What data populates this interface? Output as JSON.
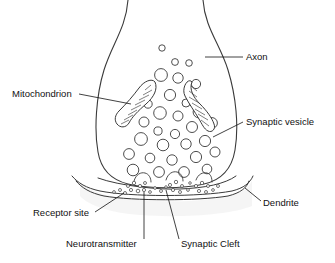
{
  "figure": {
    "style": {
      "stroke": "#3a3a3a",
      "fill": "#ffffff",
      "shade": "#f0f0f0",
      "text": "#111111",
      "background": "#ffffff"
    }
  },
  "labels": [
    {
      "id": "axon",
      "text": "Axon",
      "x": 246,
      "y": 60,
      "anchor": "start",
      "leader": "M 243 57 L 205 57"
    },
    {
      "id": "mitochondrion",
      "text": "Mitochondrion",
      "x": 12,
      "y": 97,
      "anchor": "start",
      "leader": "M 79 94 L 131 104"
    },
    {
      "id": "synaptic-vesicle",
      "text": "Synaptic vesicle",
      "x": 246,
      "y": 125,
      "anchor": "start",
      "leader": "M 243 122 L 213 137"
    },
    {
      "id": "receptor-site",
      "text": "Receptor site",
      "x": 33,
      "y": 216,
      "anchor": "start",
      "leader": "M 95 212 L 124 193"
    },
    {
      "id": "dendrite",
      "text": "Dendrite",
      "x": 263,
      "y": 206,
      "anchor": "start",
      "leader": "M 261 201 L 245 188"
    },
    {
      "id": "neurotransmitter",
      "text": "Neurotransmitter",
      "x": 66,
      "y": 247,
      "anchor": "start",
      "leader": "M 144 239 L 144 192"
    },
    {
      "id": "synaptic-cleft",
      "text": "Synaptic Cleft",
      "x": 181,
      "y": 247,
      "anchor": "start",
      "leader": "M 179 239 L 166 190"
    }
  ],
  "axon_terminal": {
    "outline": "M 128 0 C 126 28 112 44 104 70 C 96 96 94 130 98 152 C 101 170 112 180 128 184 C 150 189 182 189 204 184 C 222 180 232 168 235 150 C 239 126 236 96 228 70 C 220 44 205 28 203 0"
  },
  "vesicles": [
    {
      "cx": 162,
      "cy": 48,
      "r": 3.2
    },
    {
      "cx": 175,
      "cy": 62,
      "r": 3.4
    },
    {
      "cx": 189,
      "cy": 63,
      "r": 3.3
    },
    {
      "cx": 161,
      "cy": 75,
      "r": 6.4
    },
    {
      "cx": 178,
      "cy": 78,
      "r": 5.2
    },
    {
      "cx": 196,
      "cy": 84,
      "r": 4.6
    },
    {
      "cx": 170,
      "cy": 95,
      "r": 5.6
    },
    {
      "cx": 148,
      "cy": 104,
      "r": 4.2
    },
    {
      "cx": 186,
      "cy": 103,
      "r": 4.0
    },
    {
      "cx": 160,
      "cy": 113,
      "r": 6.3
    },
    {
      "cx": 178,
      "cy": 116,
      "r": 5.0
    },
    {
      "cx": 199,
      "cy": 112,
      "r": 5.9
    },
    {
      "cx": 144,
      "cy": 122,
      "r": 5.0
    },
    {
      "cx": 192,
      "cy": 127,
      "r": 5.5
    },
    {
      "cx": 212,
      "cy": 123,
      "r": 5.4
    },
    {
      "cx": 158,
      "cy": 131,
      "r": 4.1
    },
    {
      "cx": 175,
      "cy": 134,
      "r": 4.6
    },
    {
      "cx": 141,
      "cy": 139,
      "r": 6.4
    },
    {
      "cx": 163,
      "cy": 145,
      "r": 5.8
    },
    {
      "cx": 186,
      "cy": 144,
      "r": 5.2
    },
    {
      "cx": 205,
      "cy": 141,
      "r": 5.6
    },
    {
      "cx": 129,
      "cy": 154,
      "r": 5.4
    },
    {
      "cx": 150,
      "cy": 158,
      "r": 4.8
    },
    {
      "cx": 172,
      "cy": 160,
      "r": 5.2
    },
    {
      "cx": 196,
      "cy": 157,
      "r": 5.6
    },
    {
      "cx": 215,
      "cy": 152,
      "r": 5.0
    },
    {
      "cx": 133,
      "cy": 170,
      "r": 5.8
    },
    {
      "cx": 159,
      "cy": 172,
      "r": 5.4
    },
    {
      "cx": 184,
      "cy": 172,
      "r": 5.4
    },
    {
      "cx": 207,
      "cy": 169,
      "r": 4.8
    }
  ],
  "mitochondria": [
    {
      "id": "mitochondrion-left",
      "outline": "M 155 82 C 158 89 154 97 146 104 C 138 111 132 117 129 123 C 126 128 120 128 117 124 C 114 120 115 115 119 111 C 127 103 133 96 139 88 C 144 81 152 78 155 82 Z",
      "cristae": [
        "M 151 85 L 145 90",
        "M 152 90 L 143 95",
        "M 149 95 L 139 100",
        "M 145 100 L 135 105",
        "M 141 105 L 131 110",
        "M 137 110 L 128 115",
        "M 133 115 L 124 120",
        "M 129 120 L 121 124"
      ]
    },
    {
      "id": "mitochondrion-right",
      "outline": "M 192 82 C 189 89 193 97 200 104 C 207 111 212 118 214 124 C 216 129 212 133 208 131 C 204 129 202 124 199 119 C 195 112 189 104 185 96 C 181 88 188 77 192 82 Z",
      "cristae": [
        "M 191 86 L 197 91",
        "M 189 91 L 197 97",
        "M 189 97 L 199 103",
        "M 192 103 L 202 109",
        "M 195 109 L 205 115",
        "M 198 114 L 208 120",
        "M 201 120 L 209 126"
      ]
    }
  ],
  "cleft": {
    "presynaptic_membrane": "M 98 178 C 120 186 160 190 180 189 C 205 188 225 184 236 176",
    "postsynaptic_membrane_top": "M 72 176 C 78 183 86 188 100 191 C 130 197 200 197 232 191 C 244 188 250 183 253 176",
    "postsynaptic_membrane_bottom": "M 76 181 C 82 188 90 193 104 196 C 133 201 198 201 228 196 C 240 193 247 188 249 181",
    "release_notches": [
      "M 134 181 C 136 174 141 172 145 173 C 149 174 151 178 151 182",
      "M 166 180 C 168 173 173 171 177 172 C 181 173 183 177 183 181",
      "M 196 180 C 198 174 203 172 207 173 C 211 174 212 178 212 182"
    ]
  },
  "neurotransmitters": [
    {
      "cx": 128,
      "cy": 186,
      "r": 1.5
    },
    {
      "cx": 134,
      "cy": 183,
      "r": 1.7
    },
    {
      "cx": 140,
      "cy": 186,
      "r": 1.6
    },
    {
      "cx": 145,
      "cy": 183,
      "r": 1.5
    },
    {
      "cx": 131,
      "cy": 190,
      "r": 1.6
    },
    {
      "cx": 138,
      "cy": 191,
      "r": 1.8
    },
    {
      "cx": 144,
      "cy": 190,
      "r": 1.6
    },
    {
      "cx": 120,
      "cy": 190,
      "r": 1.5
    },
    {
      "cx": 114,
      "cy": 192,
      "r": 1.4
    },
    {
      "cx": 125,
      "cy": 193,
      "r": 1.5
    },
    {
      "cx": 150,
      "cy": 192,
      "r": 1.4
    },
    {
      "cx": 161,
      "cy": 191,
      "r": 1.5
    },
    {
      "cx": 170,
      "cy": 185,
      "r": 1.6
    },
    {
      "cx": 176,
      "cy": 182,
      "r": 1.7
    },
    {
      "cx": 182,
      "cy": 186,
      "r": 1.5
    },
    {
      "cx": 173,
      "cy": 190,
      "r": 1.6
    },
    {
      "cx": 180,
      "cy": 192,
      "r": 1.5
    },
    {
      "cx": 188,
      "cy": 190,
      "r": 1.4
    },
    {
      "cx": 196,
      "cy": 186,
      "r": 1.6
    },
    {
      "cx": 202,
      "cy": 183,
      "r": 1.7
    },
    {
      "cx": 208,
      "cy": 186,
      "r": 1.5
    },
    {
      "cx": 199,
      "cy": 191,
      "r": 1.6
    },
    {
      "cx": 206,
      "cy": 192,
      "r": 1.5
    },
    {
      "cx": 213,
      "cy": 190,
      "r": 1.4
    },
    {
      "cx": 218,
      "cy": 186,
      "r": 1.5
    },
    {
      "cx": 155,
      "cy": 188,
      "r": 1.4
    },
    {
      "cx": 190,
      "cy": 183,
      "r": 1.3
    },
    {
      "cx": 166,
      "cy": 187,
      "r": 1.3
    }
  ]
}
